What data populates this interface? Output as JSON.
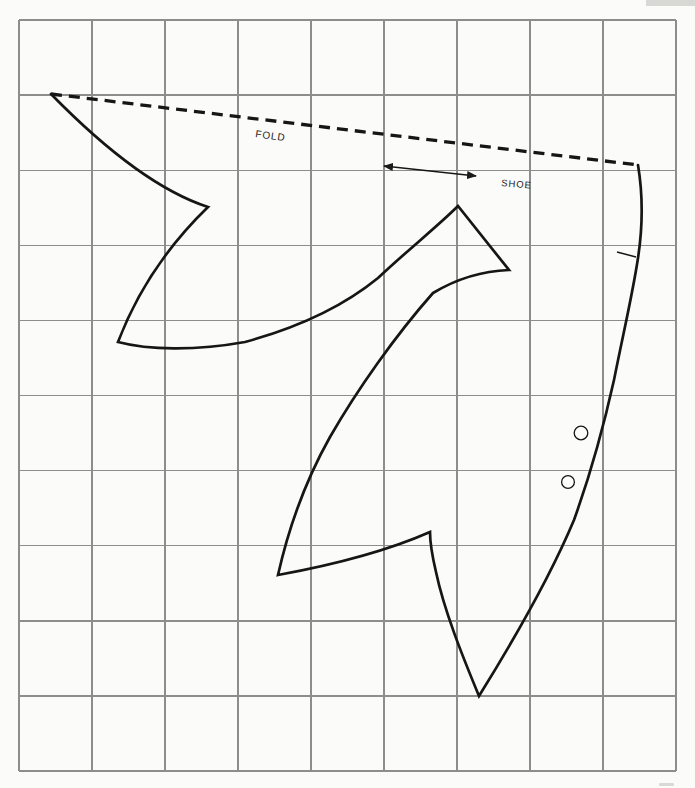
{
  "canvas": {
    "width": 695,
    "height": 788,
    "background": "#fbfbf9"
  },
  "grid": {
    "x0": 19,
    "y0": 20,
    "cols": 9,
    "rows": 10,
    "cell_width": 73.0,
    "cell_height": 75.1,
    "line_color": "#8d8d8d",
    "line_width": 1.4
  },
  "corner_tab": {
    "x": 646,
    "y": 0,
    "width": 49,
    "height": 6,
    "color": "#d8d8d5"
  },
  "page_edge_mark": {
    "x": 659,
    "y": 783,
    "width": 15,
    "height": 3,
    "color": "#d9d9d5"
  },
  "pattern": {
    "line_color": "#161616",
    "outline_width": 2.7,
    "outline_path": "M 638 165 C 643 195 643 225 638 258 C 633 292 624 330 614 380 C 604 425 592 470 574 520 C 553 570 520 630 479 696 C 462 655 444 610 436 572 C 432 555 430 542 430 532 C 405 543 360 560 278 575 C 287 535 303 485 330 437 C 357 390 395 336 433 293 C 458 278 482 271 509 270 L 458 206 C 438 226 410 248 378 278 C 345 305 300 327 245 342 C 195 351 148 350 118 342 Q 147 266 208 207 Q 140 185 51 94",
    "fold_line": {
      "x1": 51,
      "y1": 94,
      "x2": 638,
      "y2": 165,
      "width": 3.3,
      "dash": "11 7"
    },
    "fold_label": {
      "text": "FOLD",
      "x": 255,
      "y": 137,
      "font_size": 10,
      "transform": "rotate(8 255 137)"
    },
    "grain_arrow": {
      "x1": 384,
      "y1": 166,
      "x2": 476,
      "y2": 176,
      "width": 1.3
    },
    "shoe_label": {
      "text": "SHOE",
      "x": 501,
      "y": 186,
      "font_size": 9.5,
      "transform": "rotate(5 501 186)"
    },
    "notch": {
      "x1": 617,
      "y1": 252,
      "x2": 636,
      "y2": 257,
      "width": 1.5
    },
    "eyelets": [
      {
        "cx": 581,
        "cy": 433,
        "r": 6.8
      },
      {
        "cx": 568,
        "cy": 482,
        "r": 6.4
      }
    ],
    "eyelet_stroke_width": 1.3
  }
}
